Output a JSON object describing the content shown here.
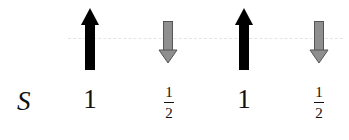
{
  "diagram": {
    "row_label": "S",
    "sites": [
      {
        "spin": "up",
        "color": "#000000",
        "value_num": "1",
        "value_den": null
      },
      {
        "spin": "down",
        "color": "#8a8a8a",
        "value_num": "1",
        "value_den": "2"
      },
      {
        "spin": "up",
        "color": "#000000",
        "value_num": "1",
        "value_den": null
      },
      {
        "spin": "down",
        "color": "#8a8a8a",
        "value_num": "1",
        "value_den": "2"
      }
    ]
  }
}
